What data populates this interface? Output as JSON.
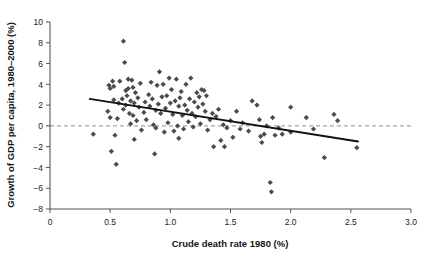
{
  "chart_data": {
    "type": "scatter",
    "title": "",
    "xlabel": "Crude death rate 1980 (%)",
    "ylabel": "Growth of GDP per capita, 1980–2000 (%)",
    "xlim": [
      0,
      3.0
    ],
    "ylim": [
      -8,
      10
    ],
    "xticks": [
      "0",
      "0.5",
      "1.0",
      "1.5",
      "2.0",
      "2.5",
      "3.0"
    ],
    "xtick_values": [
      0,
      0.5,
      1.0,
      1.5,
      2.0,
      2.5,
      3.0
    ],
    "yticks": [
      "10",
      "8",
      "6",
      "4",
      "2",
      "0",
      "−2",
      "−4",
      "−6",
      "−8"
    ],
    "ytick_values": [
      10,
      8,
      6,
      4,
      2,
      0,
      -2,
      -4,
      -6,
      -8
    ],
    "grid": false,
    "legend": null,
    "marker_shape": "diamond",
    "marker_color": "#4a4a52",
    "reference_line": {
      "axis": "y",
      "value": 0,
      "style": "dashed",
      "color": "#8c8c8c"
    },
    "trend_line": {
      "style": "solid",
      "color": "#111111",
      "x_start": 0.33,
      "y_start": 2.6,
      "x_end": 2.56,
      "y_end": -1.5
    },
    "points": [
      [
        0.36,
        -0.8
      ],
      [
        0.48,
        1.4
      ],
      [
        0.49,
        3.9
      ],
      [
        0.5,
        3.6
      ],
      [
        0.5,
        0.8
      ],
      [
        0.51,
        -2.45
      ],
      [
        0.52,
        4.3
      ],
      [
        0.53,
        3.8
      ],
      [
        0.53,
        2.5
      ],
      [
        0.54,
        -0.9
      ],
      [
        0.55,
        -3.7
      ],
      [
        0.56,
        0.7
      ],
      [
        0.57,
        2.2
      ],
      [
        0.58,
        4.3
      ],
      [
        0.6,
        2.6
      ],
      [
        0.61,
        8.15
      ],
      [
        0.61,
        1.6
      ],
      [
        0.62,
        6.1
      ],
      [
        0.63,
        3.4
      ],
      [
        0.63,
        2.0
      ],
      [
        0.64,
        2.9
      ],
      [
        0.65,
        4.5
      ],
      [
        0.65,
        3.6
      ],
      [
        0.66,
        1.2
      ],
      [
        0.67,
        2.4
      ],
      [
        0.67,
        0.2
      ],
      [
        0.68,
        4.4
      ],
      [
        0.69,
        3.7
      ],
      [
        0.69,
        1.0
      ],
      [
        0.7,
        2.2
      ],
      [
        0.7,
        -1.3
      ],
      [
        0.71,
        3.2
      ],
      [
        0.72,
        0.5
      ],
      [
        0.73,
        2.7
      ],
      [
        0.74,
        1.8
      ],
      [
        0.75,
        4.1
      ],
      [
        0.76,
        -0.4
      ],
      [
        0.78,
        1.3
      ],
      [
        0.79,
        2.3
      ],
      [
        0.8,
        0.6
      ],
      [
        0.82,
        3.0
      ],
      [
        0.83,
        1.9
      ],
      [
        0.84,
        4.2
      ],
      [
        0.85,
        2.6
      ],
      [
        0.86,
        0.1
      ],
      [
        0.87,
        -2.7
      ],
      [
        0.88,
        1.5
      ],
      [
        0.88,
        -0.2
      ],
      [
        0.89,
        3.9
      ],
      [
        0.9,
        2.1
      ],
      [
        0.91,
        5.2
      ],
      [
        0.92,
        1.2
      ],
      [
        0.93,
        2.8
      ],
      [
        0.94,
        4.0
      ],
      [
        0.95,
        -0.6
      ],
      [
        0.96,
        1.7
      ],
      [
        0.97,
        2.9
      ],
      [
        0.98,
        0.3
      ],
      [
        0.99,
        4.6
      ],
      [
        1.0,
        2.2
      ],
      [
        1.01,
        3.5
      ],
      [
        1.02,
        1.1
      ],
      [
        1.03,
        -0.5
      ],
      [
        1.04,
        2.4
      ],
      [
        1.05,
        4.5
      ],
      [
        1.06,
        0.0
      ],
      [
        1.07,
        1.9
      ],
      [
        1.07,
        -1.2
      ],
      [
        1.08,
        2.7
      ],
      [
        1.09,
        3.3
      ],
      [
        1.1,
        1.0
      ],
      [
        1.11,
        -0.3
      ],
      [
        1.12,
        2.0
      ],
      [
        1.13,
        4.0
      ],
      [
        1.14,
        1.5
      ],
      [
        1.15,
        0.4
      ],
      [
        1.16,
        2.6
      ],
      [
        1.17,
        4.6
      ],
      [
        1.18,
        1.2
      ],
      [
        1.19,
        -0.1
      ],
      [
        1.2,
        2.3
      ],
      [
        1.21,
        0.9
      ],
      [
        1.22,
        3.2
      ],
      [
        1.23,
        1.8
      ],
      [
        1.24,
        2.8
      ],
      [
        1.25,
        0.2
      ],
      [
        1.26,
        3.5
      ],
      [
        1.27,
        2.1
      ],
      [
        1.28,
        3.4
      ],
      [
        1.29,
        1.4
      ],
      [
        1.3,
        2.9
      ],
      [
        1.31,
        -0.4
      ],
      [
        1.33,
        0.6
      ],
      [
        1.35,
        1.2
      ],
      [
        1.36,
        -2.0
      ],
      [
        1.38,
        0.9
      ],
      [
        1.4,
        1.6
      ],
      [
        1.42,
        -1.4
      ],
      [
        1.44,
        0.1
      ],
      [
        1.45,
        -2.0
      ],
      [
        1.47,
        -0.2
      ],
      [
        1.5,
        0.5
      ],
      [
        1.52,
        -1.1
      ],
      [
        1.55,
        1.4
      ],
      [
        1.58,
        -0.3
      ],
      [
        1.6,
        0.3
      ],
      [
        1.65,
        -0.5
      ],
      [
        1.68,
        2.4
      ],
      [
        1.72,
        2.0
      ],
      [
        1.74,
        0.6
      ],
      [
        1.75,
        -1.0
      ],
      [
        1.76,
        -1.6
      ],
      [
        1.78,
        -0.8
      ],
      [
        1.8,
        0.0
      ],
      [
        1.83,
        -5.45
      ],
      [
        1.84,
        -6.35
      ],
      [
        1.85,
        0.8
      ],
      [
        1.87,
        -0.9
      ],
      [
        1.9,
        -0.2
      ],
      [
        1.93,
        -0.8
      ],
      [
        2.0,
        1.8
      ],
      [
        2.0,
        -0.6
      ],
      [
        2.13,
        0.8
      ],
      [
        2.19,
        -0.3
      ],
      [
        2.28,
        -3.05
      ],
      [
        2.36,
        1.1
      ],
      [
        2.39,
        0.5
      ],
      [
        2.55,
        -2.1
      ]
    ]
  }
}
